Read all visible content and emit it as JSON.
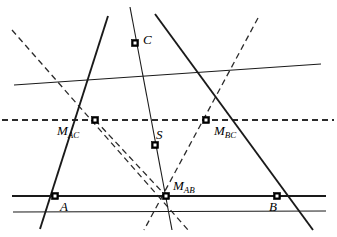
{
  "figure": {
    "width": 337,
    "height": 237,
    "background": "#ffffff",
    "stroke_color": "#1a1a1a",
    "dash_color": "#2b2b2b"
  },
  "labels": {
    "vertex_a": "A",
    "vertex_b": "B",
    "vertex_c": "C",
    "centroid": "S",
    "mid_ac_main": "M",
    "mid_ac_sub": "AC",
    "mid_bc_main": "M",
    "mid_bc_sub": "BC",
    "mid_ab_main": "M",
    "mid_ab_sub": "AB"
  },
  "points": {
    "A": {
      "x": 55,
      "y": 196
    },
    "B": {
      "x": 277,
      "y": 196
    },
    "C": {
      "x": 135,
      "y": 43
    },
    "M_AC": {
      "x": 95,
      "y": 120
    },
    "M_BC": {
      "x": 206,
      "y": 120
    },
    "M_AB": {
      "x": 166,
      "y": 196
    },
    "S": {
      "x": 155,
      "y": 145
    }
  },
  "label_positions": {
    "A": {
      "x": 60,
      "y": 200
    },
    "B": {
      "x": 269,
      "y": 200
    },
    "C": {
      "x": 143,
      "y": 33
    },
    "S": {
      "x": 156,
      "y": 128
    },
    "M_AC": {
      "x": 57,
      "y": 124
    },
    "M_BC": {
      "x": 214,
      "y": 124
    },
    "M_AB": {
      "x": 173,
      "y": 179
    }
  },
  "segments": {
    "solid": [
      {
        "name": "line-AB-extended",
        "x1": 12,
        "y1": 196,
        "x2": 326,
        "y2": 196,
        "width": 1.9
      },
      {
        "name": "side-AC-extended",
        "x1": 108,
        "y1": 16,
        "x2": 40,
        "y2": 229,
        "width": 1.9
      },
      {
        "name": "side-BC-extended",
        "x1": 155,
        "y1": 14,
        "x2": 313,
        "y2": 230,
        "width": 1.9
      },
      {
        "name": "median-C-to-MAB",
        "x1": 130,
        "y1": 7,
        "x2": 172,
        "y2": 230,
        "width": 1.1
      },
      {
        "name": "median-A-to-MBC",
        "x1": 13,
        "y1": 212,
        "x2": 326,
        "y2": 211,
        "width": 1.1
      },
      {
        "name": "median-B-to-MAC",
        "x1": 14,
        "y1": 85,
        "x2": 321,
        "y2": 64,
        "width": 1.1
      }
    ],
    "dashed": [
      {
        "name": "midline-MAC-MBC-extended",
        "x1": 2,
        "y1": 120,
        "x2": 334,
        "y2": 120,
        "width": 1.9
      },
      {
        "name": "cevian-dash-left",
        "x1": 12,
        "y1": 30,
        "x2": 188,
        "y2": 230,
        "width": 1.3
      },
      {
        "name": "cevian-dash-right",
        "x1": 258,
        "y1": 18,
        "x2": 144,
        "y2": 230,
        "width": 1.3
      },
      {
        "name": "cevian-dash-MAC-to-MAB",
        "x1": 95,
        "y1": 120,
        "x2": 166,
        "y2": 196,
        "width": 1.3
      }
    ]
  },
  "markers": {
    "size": 7,
    "style": "filled-square-with-cross"
  }
}
